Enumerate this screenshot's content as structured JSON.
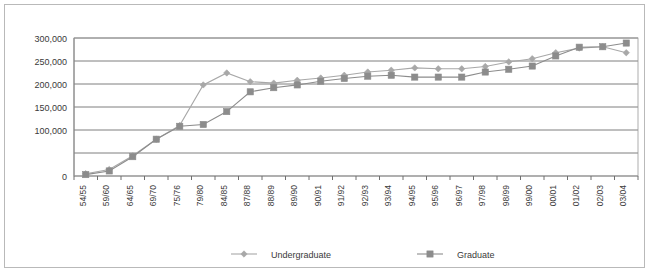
{
  "chart_data": {
    "type": "line",
    "title": "",
    "xlabel": "",
    "ylabel": "",
    "ylim": [
      0,
      300000
    ],
    "yticks": [
      0,
      50000,
      100000,
      150000,
      200000,
      250000,
      300000
    ],
    "ytick_labels": [
      "0",
      "",
      "100,000",
      "150,000",
      "200,000",
      "250,000",
      "300,000"
    ],
    "grid": true,
    "legend_position": "bottom",
    "categories": [
      "54/55",
      "59/60",
      "64/65",
      "69/70",
      "75/76",
      "79/80",
      "84/85",
      "87/88",
      "88/89",
      "89/90",
      "90/91",
      "91/92",
      "92/93",
      "93/94",
      "94/95",
      "95/96",
      "96/97",
      "97/98",
      "98/99",
      "99/00",
      "00/01",
      "01/02",
      "02/03",
      "03/04"
    ],
    "series": [
      {
        "name": "Undergraduate",
        "color": "#a8a8a8",
        "marker": "diamond",
        "values": [
          5000,
          14000,
          44000,
          80000,
          110000,
          198000,
          224000,
          205000,
          202000,
          208000,
          213000,
          219000,
          226000,
          230000,
          235000,
          233000,
          233000,
          238000,
          248000,
          255000,
          268000,
          278000,
          281000,
          268000
        ]
      },
      {
        "name": "Graduate",
        "color": "#8c8c8c",
        "marker": "square",
        "values": [
          3000,
          11000,
          42000,
          80000,
          108000,
          112000,
          140000,
          183000,
          192000,
          198000,
          206000,
          212000,
          217000,
          219000,
          215000,
          215000,
          215000,
          226000,
          232000,
          239000,
          261000,
          280000,
          281000,
          289000
        ]
      }
    ]
  },
  "legend": {
    "items": [
      {
        "label": "Undergraduate",
        "marker": "diamond-marker",
        "color": "#a8a8a8"
      },
      {
        "label": "Graduate",
        "marker": "square-marker",
        "color": "#8c8c8c"
      }
    ]
  },
  "colors": {
    "undergraduate": "#a8a8a8",
    "graduate": "#8c8c8c",
    "grid": "#6f6f6f",
    "frame": "#b9b9b9",
    "text": "#3a3a3a",
    "background": "#ffffff"
  }
}
